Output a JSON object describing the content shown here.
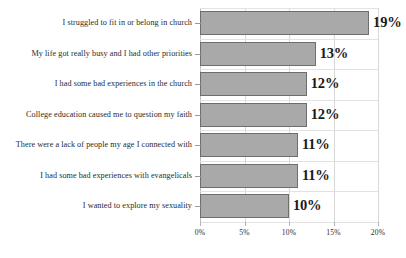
{
  "chart_data": {
    "type": "bar",
    "orientation": "horizontal",
    "title": "",
    "subtitle": "",
    "xlabel": "",
    "ylabel": "",
    "categories": [
      "I struggled to fit in or belong in church",
      "My life got really busy and I had other priorities",
      "I had some bad experiences in the church",
      "College education caused me to question my faith",
      "There were a lack of people my age I connected with",
      "I had some bad experiences with evangelicals",
      "I wanted to explore my sexuality"
    ],
    "values": [
      19,
      13,
      12,
      12,
      11,
      11,
      10
    ],
    "data_labels": [
      "19%",
      "13%",
      "12%",
      "12%",
      "11%",
      "11%",
      "10%"
    ],
    "xlim": [
      0,
      20
    ],
    "xticks": [
      0,
      5,
      10,
      15,
      20
    ],
    "xtick_labels": [
      "0%",
      "5%",
      "10%",
      "15%",
      "20%"
    ],
    "grid": true,
    "legend": null,
    "colors": {
      "bar_fill": "#a9a9a9",
      "bar_border": "#6e6e6e",
      "gridline": "#d8d8d8",
      "text": "#2b2b2b",
      "background": "#ffffff"
    }
  }
}
